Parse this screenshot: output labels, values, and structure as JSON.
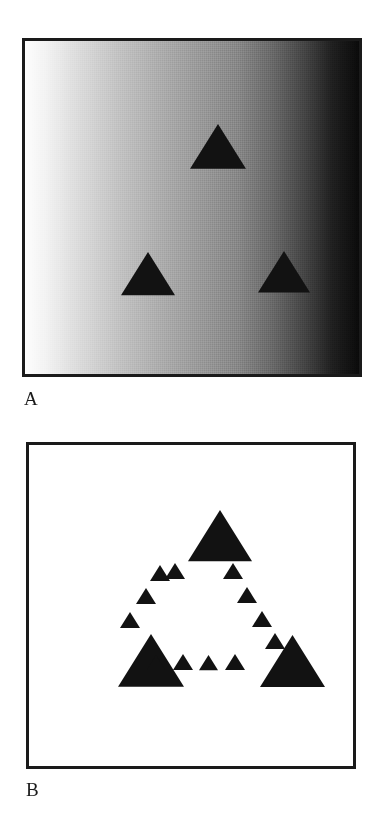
{
  "figure": {
    "background_color": "#ffffff",
    "width": 381,
    "height": 824,
    "panels": [
      {
        "id": "A",
        "label": "A",
        "type": "luminance-gradient-with-triangles",
        "frame_color": "#1a1a1a",
        "background": "horizontal luminance gradient, white at left to black at right",
        "gradient_start_color": "#fdfdfd",
        "gradient_end_color": "#0a0a0a",
        "shape_color": "#121212",
        "shape_count": 3,
        "shapes": [
          {
            "name": "triangle-top",
            "cx": 168,
            "cy": 86,
            "size": 56
          },
          {
            "name": "triangle-bottom-left",
            "cx": 99,
            "cy": 214,
            "size": 54
          },
          {
            "name": "triangle-bottom-right",
            "cx": 236,
            "cy": 213,
            "size": 52
          }
        ]
      },
      {
        "id": "B",
        "label": "B",
        "type": "illusory-triangle-contour",
        "frame_color": "#1a1a1a",
        "background": "#ffffff",
        "shape_color": "#121212",
        "large_shape_count": 3,
        "small_shape_count": 12,
        "large_shapes": [
          {
            "name": "triangle-large-top",
            "cx": 162,
            "cy": 68,
            "size": 64
          },
          {
            "name": "triangle-large-bottom-left",
            "cx": 92,
            "cy": 192,
            "size": 66
          },
          {
            "name": "triangle-large-bottom-right",
            "cx": 234,
            "cy": 193,
            "size": 65
          }
        ],
        "small_shapes": [
          {
            "name": "triangle-small-left-1",
            "cx": 124,
            "cy": 123,
            "size": 20
          },
          {
            "name": "triangle-small-left-2",
            "cx": 110,
            "cy": 146,
            "size": 20
          },
          {
            "name": "triangle-small-left-3",
            "cx": 94,
            "cy": 170,
            "size": 20
          },
          {
            "name": "triangle-small-right-1",
            "cx": 197,
            "cy": 121,
            "size": 20
          },
          {
            "name": "triangle-small-right-2",
            "cx": 211,
            "cy": 145,
            "size": 20
          },
          {
            "name": "triangle-small-right-3",
            "cx": 226,
            "cy": 169,
            "size": 20
          },
          {
            "name": "triangle-small-right-4",
            "cx": 239,
            "cy": 191,
            "size": 20
          },
          {
            "name": "triangle-small-bottom-1",
            "cx": 121,
            "cy": 213,
            "size": 18
          },
          {
            "name": "triangle-small-bottom-2",
            "cx": 147,
            "cy": 212,
            "size": 20
          },
          {
            "name": "triangle-small-bottom-3",
            "cx": 173,
            "cy": 213,
            "size": 19
          },
          {
            "name": "triangle-small-bottom-4",
            "cx": 199,
            "cy": 212,
            "size": 20
          },
          {
            "name": "triangle-small-left-0",
            "cx": 139,
            "cy": 121,
            "size": 20
          }
        ]
      }
    ]
  },
  "labels": {
    "panel_a": "A",
    "panel_b": "B"
  }
}
